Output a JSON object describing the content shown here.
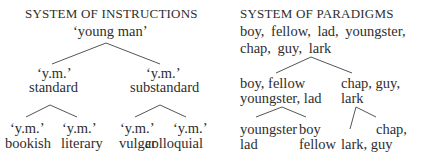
{
  "left": {
    "title": "SYSTEM OF INSTRUCTIONS",
    "root": "‘young man’",
    "level1": [
      {
        "code": "‘y.m.’",
        "label": "standard"
      },
      {
        "code": "‘y.m.’",
        "label": "substandard"
      }
    ],
    "level2": [
      {
        "code": "‘y.m.’",
        "label": "bookish"
      },
      {
        "code": "‘y.m.’",
        "label": "literary"
      },
      {
        "code": "‘y.m.’",
        "label": "vulgar"
      },
      {
        "code": "‘y.m.’",
        "label": "colloquial"
      }
    ]
  },
  "right": {
    "title": "SYSTEM OF PARADIGMS",
    "root_line1": "boy, fellow, lad, youngster,",
    "root_line2": "chap, guy, lark",
    "level1": [
      {
        "line1": "boy, fellow",
        "line2": "youngster, lad"
      },
      {
        "line1": "chap, guy,",
        "line2": "lark"
      }
    ],
    "level2": [
      {
        "line1": "youngster",
        "line2": "lad"
      },
      {
        "line1": "boy",
        "line2": "fellow"
      },
      {
        "line1": "",
        "line2": "lark, guy"
      },
      {
        "line1": "chap,",
        "line2": ""
      }
    ]
  }
}
